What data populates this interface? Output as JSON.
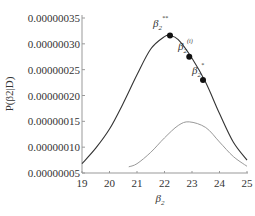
{
  "chart_data": {
    "type": "line",
    "title": "",
    "xlabel": "β2",
    "ylabel": "P(β2|D)",
    "xlim": [
      19,
      25
    ],
    "ylim": [
      5e-08,
      3.5e-07
    ],
    "x_ticks": [
      "19",
      "20",
      "21",
      "22",
      "23",
      "24",
      "25"
    ],
    "y_ticks": [
      "0.00000005",
      "0.00000010",
      "0.00000015",
      "0.00000020",
      "0.00000025",
      "0.00000030",
      "0.00000035"
    ],
    "grid": false,
    "legend": null,
    "series": [
      {
        "name": "posterior (dark)",
        "color": "#333333",
        "x": [
          19,
          19.5,
          20,
          20.5,
          21,
          21.5,
          22,
          22.2,
          22.5,
          23,
          23.5,
          24,
          24.5,
          25
        ],
        "y": [
          6.8e-08,
          9.8e-08,
          1.35e-07,
          1.85e-07,
          2.4e-07,
          2.9e-07,
          3.14e-07,
          3.16e-07,
          3.08e-07,
          2.72e-07,
          2.25e-07,
          1.65e-07,
          1.1e-07,
          7.5e-08
        ]
      },
      {
        "name": "prior (light)",
        "color": "#999999",
        "x": [
          20.7,
          21,
          21.5,
          22,
          22.5,
          22.9,
          23.5,
          24,
          24.5,
          25
        ],
        "y": [
          6.2e-08,
          6.8e-08,
          9e-08,
          1.18e-07,
          1.42e-07,
          1.49e-07,
          1.38e-07,
          1.1e-07,
          8.2e-08,
          6.3e-08
        ]
      }
    ],
    "annotations": [
      {
        "label": "β2**",
        "x": 22.2,
        "y": 3.16e-07
      },
      {
        "label": "β2(i)",
        "x": 22.9,
        "y": 2.75e-07
      },
      {
        "label": "β2*",
        "x": 23.4,
        "y": 2.3e-07
      }
    ]
  },
  "labels": {
    "xlabel_main": "β",
    "xlabel_sub": "2",
    "ylabel": "P(β2|D)",
    "ann1_main": "β",
    "ann1_sub": "2",
    "ann1_sup": "**",
    "ann2_main": "β",
    "ann2_sub": "2",
    "ann2_sup": "(i)",
    "ann3_main": "β",
    "ann3_sub": "2",
    "ann3_sup": "*"
  }
}
